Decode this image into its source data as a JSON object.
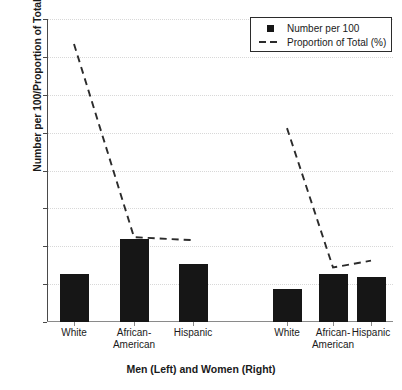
{
  "chart_data": {
    "type": "bar",
    "title": "",
    "xlabel": "Men (Left) and Women (Right)",
    "ylabel": "Number per 100/Proportion of Total (%)",
    "ylim": [
      0,
      40
    ],
    "ytick_labels": [
      "0",
      "5",
      "10",
      "15",
      "20",
      "25",
      "30",
      "35",
      "40"
    ],
    "ytick_values": [
      0,
      5,
      10,
      15,
      20,
      25,
      30,
      35,
      40
    ],
    "grid": true,
    "legend_position": "top-right",
    "groups": [
      "Men",
      "Women"
    ],
    "categories": [
      "White",
      "African-American",
      "Hispanic",
      "White",
      "African-American",
      "Hispanic"
    ],
    "category_lines": [
      [
        "White",
        ""
      ],
      [
        "African-",
        "American"
      ],
      [
        "Hispanic",
        ""
      ],
      [
        "White",
        ""
      ],
      [
        "African-",
        "American"
      ],
      [
        "Hispanic",
        ""
      ]
    ],
    "series": [
      {
        "name": "Number per 100",
        "type": "bar",
        "color": "#161616",
        "values": [
          6.4,
          10.9,
          7.6,
          4.3,
          6.4,
          6.0
        ]
      },
      {
        "name": "Proportion of Total (%)",
        "type": "line",
        "style": "dashed",
        "color": "#2b2b2b",
        "values": [
          36.7,
          11.2,
          10.8,
          25.6,
          7.2,
          8.1
        ]
      }
    ]
  },
  "legend": {
    "entries": [
      {
        "label": "Number per 100",
        "marker": "filled-square",
        "color": "#161616"
      },
      {
        "label": "Proportion of Total (%)",
        "marker": "dashed-line",
        "color": "#2b2b2b"
      }
    ]
  },
  "axes": {
    "y_title": "Number per 100/Proportion of Total (%)",
    "x_title": "Men (Left) and Women (Right)"
  }
}
